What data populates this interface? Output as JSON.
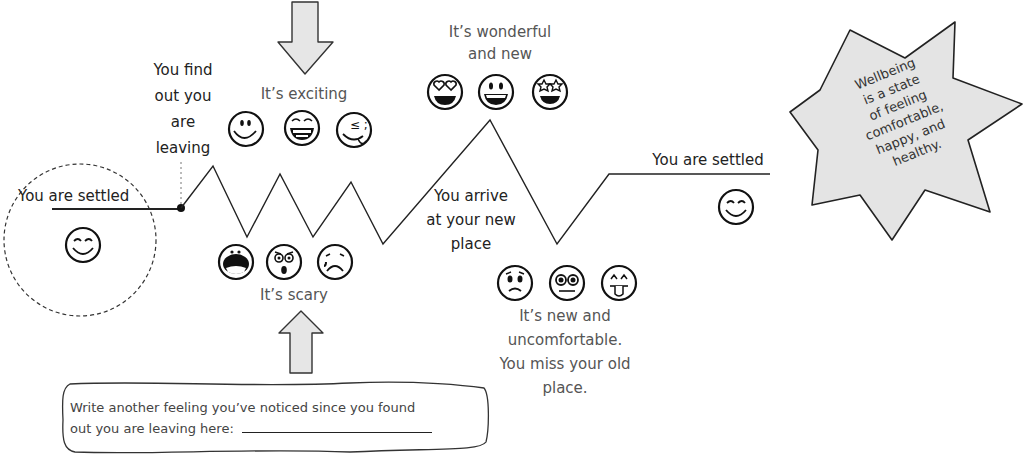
{
  "diagram": {
    "stages": [
      {
        "id": "settled-start",
        "label": "You are settled",
        "emojis": [
          "smiling-closed-eyes"
        ]
      },
      {
        "id": "find-out",
        "label": "You find out you are leaving"
      },
      {
        "id": "exciting",
        "label": "It's exciting",
        "emojis": [
          "smile",
          "grin-teeth",
          "silly-tongue"
        ]
      },
      {
        "id": "scary",
        "label": "It's scary",
        "emojis": [
          "screaming",
          "shocked",
          "crying"
        ]
      },
      {
        "id": "wonderful",
        "label": "It's wonderful and new",
        "emojis": [
          "heart-eyes",
          "big-grin",
          "star-struck"
        ]
      },
      {
        "id": "arrive",
        "label": "You arrive at your new place"
      },
      {
        "id": "uncomfortable",
        "label": "It's new and uncomfortable. You miss your old place.",
        "emojis": [
          "worried",
          "dizzy-eyes",
          "tongue-out"
        ]
      },
      {
        "id": "settled-end",
        "label": "You are settled",
        "emojis": [
          "smiling-closed-eyes"
        ]
      }
    ],
    "labels": {
      "settled_start": "You are settled",
      "find_out_1": "You find",
      "find_out_2": "out you",
      "find_out_3": "are",
      "find_out_4": "leaving",
      "exciting": "It’s exciting",
      "scary": "It’s scary",
      "wonderful_1": "It’s wonderful",
      "wonderful_2": "and new",
      "arrive_1": "You arrive",
      "arrive_2": "at your new",
      "arrive_3": "place",
      "uncomfortable_1": "It’s new and",
      "uncomfortable_2": "uncomfortable.",
      "uncomfortable_3": "You miss your old",
      "uncomfortable_4": "place.",
      "settled_end": "You are settled"
    },
    "callout": {
      "line1": "Wellbeing",
      "line2": "is a state",
      "line3": "of feeling",
      "line4": "comfortable,",
      "line5": "happy, and",
      "line6": "healthy."
    },
    "prompt": {
      "line1": "Write another feeling you’ve noticed since you found",
      "line2": "out you are leaving here:"
    },
    "colors": {
      "line": "#222222",
      "arrow_fill": "#e6e6e6",
      "star_fill": "#e4e4e4",
      "text": "#333333"
    }
  }
}
